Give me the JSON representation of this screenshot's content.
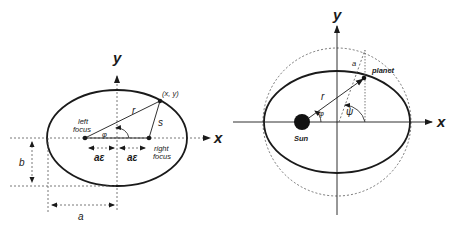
{
  "left_diagram": {
    "title": "Ellipse geometry",
    "axis_x_label": "x",
    "axis_y_label": "y",
    "point_label": "(x, y)",
    "r_label": "r",
    "s_label": "s",
    "phi_label": "φ",
    "left_focus_line1": "left",
    "left_focus_line2": "focus",
    "right_focus_line1": "right",
    "right_focus_line2": "focus",
    "ae_left_label": "aε",
    "ae_right_label": "aε",
    "b_label": "b",
    "a_label": "a"
  },
  "right_diagram": {
    "title": "Planetary orbit",
    "axis_x_label": "x",
    "axis_y_label": "y",
    "sun_label": "Sun",
    "planet_label": "planet",
    "r_label": "r",
    "a_label": "a",
    "phi_label": "φ",
    "psi_label": "ψ"
  },
  "colors": {
    "stroke": "#1a1a1a",
    "dashed": "#555555",
    "background": "#ffffff"
  }
}
